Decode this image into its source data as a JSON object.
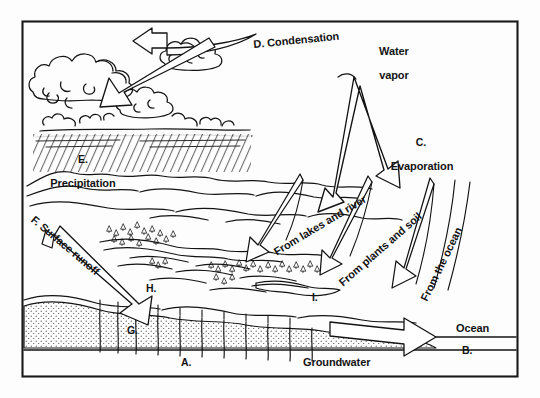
{
  "figure": {
    "kind": "labeled-science-diagram",
    "border_color": "#1a1a1a",
    "ink_color": "#131313",
    "page_background": "#fdfdfd"
  },
  "labels": {
    "a_key": "A.",
    "b_key": "B.",
    "c_key": "C.",
    "c_name": "Evaporation",
    "d_text": "D. Condensation",
    "e_key": "E.",
    "e_name": "Precipitation",
    "f_text": "F. Surface runoff",
    "g_key": "G.",
    "h_key": "H.",
    "i_key": "I.",
    "water_vapor_line1": "Water",
    "water_vapor_line2": "vapor",
    "from_lakes": "From lakes and river",
    "from_plants": "From plants and soil",
    "from_ocean": "From the ocean",
    "ocean": "Ocean",
    "groundwater": "Groundwater"
  },
  "legend_keys": [
    {
      "key": "A.",
      "meaning": "bedrock / impermeable layer"
    },
    {
      "key": "B.",
      "meaning": "ocean water body"
    },
    {
      "key": "C.",
      "meaning": "Evaporation"
    },
    {
      "key": "D.",
      "meaning": "Condensation"
    },
    {
      "key": "E.",
      "meaning": "Precipitation"
    },
    {
      "key": "F.",
      "meaning": "Surface runoff"
    },
    {
      "key": "G.",
      "meaning": "infiltration / percolation"
    },
    {
      "key": "H.",
      "meaning": "stream / river channel"
    },
    {
      "key": "I.",
      "meaning": "lake"
    }
  ],
  "processes": [
    "Evaporation",
    "Condensation",
    "Precipitation",
    "Surface runoff",
    "Groundwater flow"
  ],
  "evaporation_sources": [
    "From lakes and river",
    "From plants and soil",
    "From the ocean"
  ]
}
